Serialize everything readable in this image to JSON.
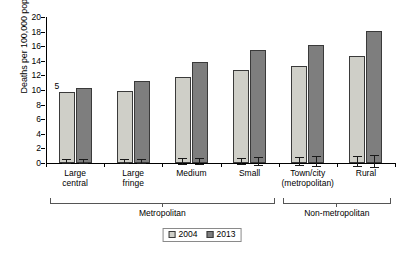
{
  "chart_data": {
    "type": "bar",
    "title": "",
    "subtitle": "",
    "xlabel": "",
    "ylabel": "Deaths per 100,000 pop.",
    "ylim": [
      0,
      20
    ],
    "yticks": [
      0,
      2,
      4,
      6,
      8,
      10,
      12,
      14,
      16,
      18,
      20
    ],
    "grid": false,
    "legend_position": "bottom-center",
    "categories": [
      "Large\ncentral",
      "Large\nfringe",
      "Medium",
      "Small",
      "Town/city\n(metropolitan)",
      "Rural"
    ],
    "category_groups": [
      {
        "label": "Metropolitan",
        "categories": [
          "Large central",
          "Large fringe",
          "Medium",
          "Small"
        ]
      },
      {
        "label": "Non-metropolitan",
        "categories": [
          "Town/city (metropolitan)",
          "Rural"
        ]
      }
    ],
    "series": [
      {
        "name": "2004",
        "color": "#cfcfc8",
        "values": [
          9.7,
          9.8,
          11.8,
          12.7,
          13.3,
          14.6
        ],
        "error_low": [
          0.25,
          0.25,
          0.45,
          0.45,
          0.6,
          0.75
        ],
        "error_high": [
          0.25,
          0.25,
          0.45,
          0.45,
          0.6,
          0.75
        ]
      },
      {
        "name": "2013",
        "color": "#7e7e7e",
        "values": [
          10.3,
          11.3,
          13.9,
          15.5,
          16.1,
          18.1
        ],
        "error_low": [
          0.3,
          0.3,
          0.4,
          0.6,
          0.7,
          0.8
        ],
        "error_high": [
          0.3,
          0.3,
          0.4,
          0.6,
          0.7,
          0.8
        ]
      }
    ],
    "annotations": [
      {
        "text": "5",
        "category": "Large central",
        "series": "2004",
        "role": "footnote-marker"
      }
    ]
  },
  "legend": {
    "items": [
      {
        "label": "2004",
        "color": "#cfcfc8"
      },
      {
        "label": "2013",
        "color": "#7e7e7e"
      }
    ]
  },
  "axis": {
    "y_title": "Deaths per 100,000 pop.",
    "y_tick_labels": [
      "20",
      "18",
      "16",
      "14",
      "12",
      "10",
      "8",
      "6",
      "4",
      "2",
      "0"
    ]
  },
  "colors": {
    "series_2004": "#cfcfc8",
    "series_2013": "#7e7e7e",
    "axis": "#000000",
    "bracket": "#555555",
    "background": "#ffffff"
  }
}
